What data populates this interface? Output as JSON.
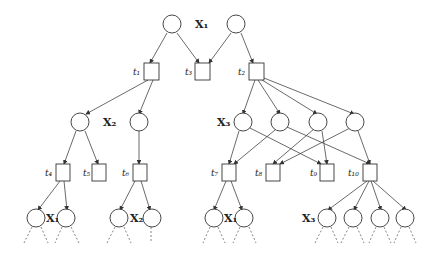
{
  "diagram": {
    "type": "tree-search-graph",
    "variable_labels": {
      "x1_top": "X₁",
      "x2": "X₂",
      "x3": "X₃",
      "x1_bl": "X₁",
      "x2_b": "X₂",
      "x1_bm": "X₁",
      "x3_b": "X₃"
    },
    "task_labels": {
      "t1": "t₁",
      "t2": "t₂",
      "t3": "t₃",
      "t4": "t₄",
      "t5": "t₅",
      "t6": "t₆",
      "t7": "t₇",
      "t8": "t₈",
      "t9": "t₉",
      "t10": "t₁₀"
    },
    "colors": {
      "stroke": "#333333",
      "background": "#ffffff"
    }
  }
}
